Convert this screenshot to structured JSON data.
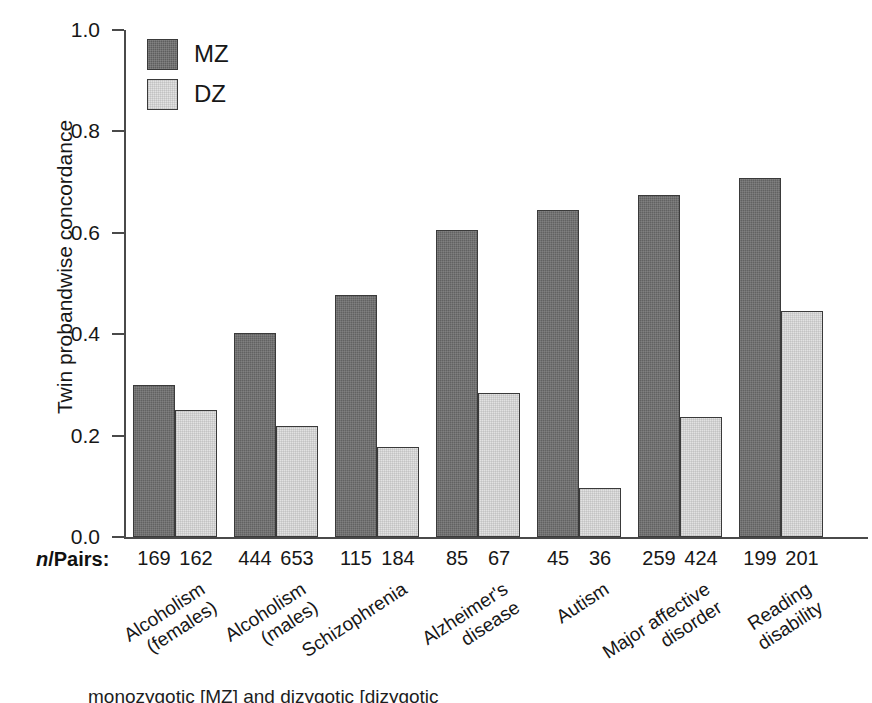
{
  "chart_data": {
    "type": "bar",
    "title": "",
    "xlabel": "",
    "ylabel": "Twin probandwise concordance",
    "ylim": [
      0.0,
      1.0
    ],
    "yticks": [
      "0.0",
      "0.2",
      "0.4",
      "0.6",
      "0.8",
      "1.0"
    ],
    "ytick_values": [
      0.0,
      0.2,
      0.4,
      0.6,
      0.8,
      1.0
    ],
    "grid": false,
    "legend_position": "top-left",
    "categories": [
      "Alcoholism\n(females)",
      "Alcoholism\n(males)",
      "Schizophrenia",
      "Alzheimer's\ndisease",
      "Autism",
      "Major affective\ndisorder",
      "Reading\ndisability"
    ],
    "series": [
      {
        "name": "MZ",
        "color": "#5e5e5e",
        "values": [
          0.3,
          0.402,
          0.478,
          0.605,
          0.645,
          0.675,
          0.708
        ]
      },
      {
        "name": "DZ",
        "color": "#e2e2e2",
        "values": [
          0.251,
          0.219,
          0.178,
          0.284,
          0.097,
          0.236,
          0.446
        ]
      }
    ],
    "annotations": {
      "npairs_label": "n/Pairs:",
      "npairs_label_italic_part": "n",
      "npairs_label_rest": "/Pairs:",
      "npairs": {
        "MZ": [
          169,
          444,
          115,
          85,
          45,
          259,
          199
        ],
        "DZ": [
          162,
          653,
          184,
          67,
          36,
          424,
          201
        ]
      }
    }
  },
  "legend": {
    "items": [
      {
        "label": "MZ",
        "swatch": "dark-gray-square"
      },
      {
        "label": "DZ",
        "swatch": "light-gray-square"
      }
    ]
  },
  "caption": {
    "text": "monozygotic [MZ] and dizygotic [dizygotic"
  }
}
